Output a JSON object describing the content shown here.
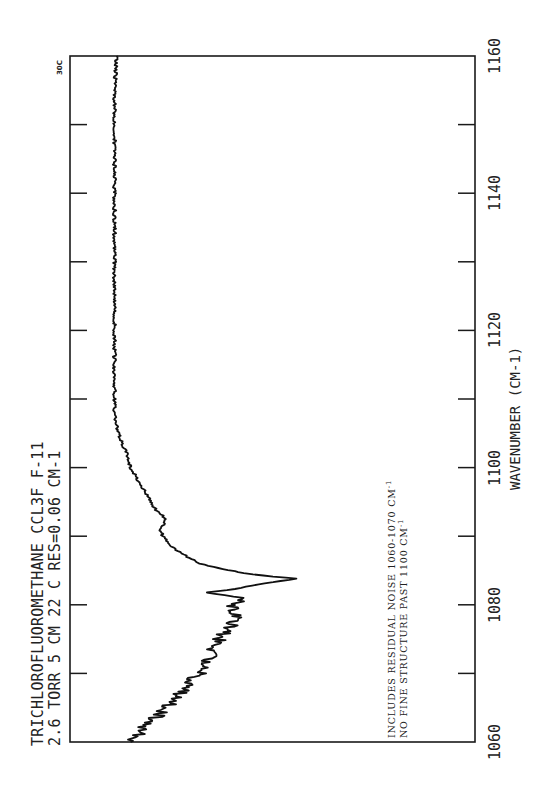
{
  "chart_data": {
    "type": "line",
    "orientation": "rotated-90-ccw",
    "title": "TRICHLOROFLUOROMETHANE   CCL3F   F-11",
    "subtitle": "2.6 TORR  5 CM  22 C        RES=0.06 CM-1",
    "xlabel": "WAVENUMBER (CM-1)",
    "ylabel": "",
    "corner_label": "30C",
    "xlim": [
      1060,
      1160
    ],
    "ylim": [
      0,
      1
    ],
    "x_ticks_labeled": [
      1060,
      1080,
      1100,
      1120,
      1140,
      1160
    ],
    "x_ticks_minor": [
      1070,
      1090,
      1110,
      1130,
      1150
    ],
    "grid": false,
    "annotations": [
      "INCLUDES RESIDUAL NOISE 1060-1070 CM-1",
      "NO FINE STRUCTURE PAST 1100 CM-1"
    ],
    "series": [
      {
        "name": "CCl3F absorption spectrum",
        "x": [
          1060.0,
          1061.0,
          1062.0,
          1063.0,
          1064.0,
          1065.0,
          1066.0,
          1067.0,
          1068.0,
          1069.0,
          1070.0,
          1071.0,
          1072.0,
          1073.0,
          1074.0,
          1075.0,
          1076.0,
          1077.0,
          1078.0,
          1079.0,
          1079.8,
          1080.5,
          1081.0,
          1081.4,
          1081.8,
          1082.3,
          1082.8,
          1083.3,
          1083.8,
          1084.1,
          1084.6,
          1085.2,
          1086.0,
          1087.0,
          1088.0,
          1089.0,
          1090.0,
          1091.0,
          1092.0,
          1093.0,
          1094.0,
          1095.0,
          1096.0,
          1097.0,
          1098.0,
          1099.0,
          1100.0,
          1102.0,
          1104.0,
          1106.0,
          1108.0,
          1110.0,
          1112.0,
          1115.0,
          1120.0,
          1125.0,
          1130.0,
          1135.0,
          1140.0,
          1145.0,
          1150.0,
          1155.0,
          1160.0
        ],
        "values": [
          0.15,
          0.17,
          0.18,
          0.2,
          0.22,
          0.23,
          0.26,
          0.27,
          0.29,
          0.3,
          0.32,
          0.33,
          0.34,
          0.35,
          0.36,
          0.37,
          0.38,
          0.4,
          0.41,
          0.41,
          0.4,
          0.43,
          0.43,
          0.38,
          0.34,
          0.41,
          0.45,
          0.5,
          0.56,
          0.5,
          0.43,
          0.38,
          0.32,
          0.29,
          0.26,
          0.24,
          0.23,
          0.22,
          0.235,
          0.23,
          0.21,
          0.2,
          0.19,
          0.18,
          0.17,
          0.16,
          0.15,
          0.14,
          0.125,
          0.115,
          0.11,
          0.11,
          0.11,
          0.11,
          0.11,
          0.11,
          0.11,
          0.11,
          0.11,
          0.11,
          0.11,
          0.11,
          0.115
        ]
      }
    ]
  },
  "labels": {
    "title_line1": "TRICHLOROFLUOROMETHANE   CCL3F   F-11",
    "title_line2": "2.6 TORR  5 CM  22 C        RES=0.06 CM-1",
    "xlabel": "WAVENUMBER (CM-1)",
    "corner": "30C",
    "note_line1": "INCLUDES RESIDUAL NOISE 1060-1070 CM",
    "note_line1_sup": "-1",
    "note_line2": "NO FINE STRUCTURE PAST 1100 CM",
    "note_line2_sup": "-1",
    "ticks": [
      "1060",
      "1080",
      "1100",
      "1120",
      "1140",
      "1160"
    ]
  },
  "colors": {
    "ink": "#1a1a1a",
    "paper": "#ffffff"
  }
}
